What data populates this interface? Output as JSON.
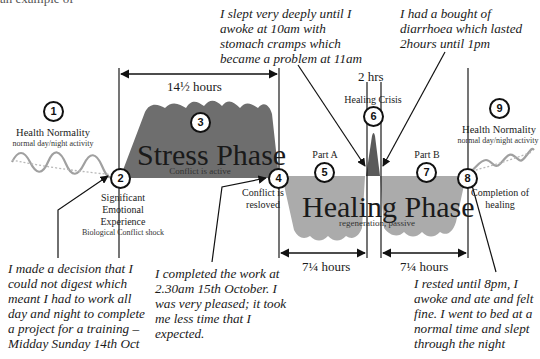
{
  "header": {
    "cropped_text": "an example of"
  },
  "colors": {
    "stress_fill": "#6e6e6e",
    "healing_fill": "#ababab",
    "crisis_fill": "#5a5a5a",
    "wave": "#9a9a9a",
    "line": "#1a1a1a"
  },
  "stages": [
    {
      "num": "1",
      "title": "Health Normality",
      "subtitle": "normal day/night activity"
    },
    {
      "num": "2",
      "title": "Significant Emotional Experience",
      "title_lines": [
        "Significant",
        "Emotional",
        "Experience"
      ],
      "subtitle": "Biological Conflict shock"
    },
    {
      "num": "3",
      "title": "Stress Phase",
      "subtitle": "Conflict is active"
    },
    {
      "num": "4",
      "title": "Conflict is resloved",
      "title_lines": [
        "Conflict is",
        "resloved"
      ]
    },
    {
      "num": "5",
      "title": "Part A"
    },
    {
      "num": "6",
      "title": "Healing Crisis"
    },
    {
      "num": "7",
      "title": "Part B"
    },
    {
      "num": "8",
      "title": "Completion of healing",
      "title_lines": [
        "Completion of",
        "healing"
      ]
    },
    {
      "num": "9",
      "title": "Health Normality",
      "subtitle": "normal day/night activity"
    }
  ],
  "healing_phase": {
    "title": "Healing Phase",
    "subtitle": "regeneration, passive"
  },
  "durations": {
    "stress": "14½ hours",
    "crisis": "2 hrs",
    "part_a": "7¼ hours",
    "part_b": "7¼ hours"
  },
  "notes": {
    "decision": [
      "I made a decision that I",
      "could not digest which",
      "meant I had to work all",
      "day and night to complete",
      "a project for a training –",
      "Midday Sunday 14th Oct"
    ],
    "completed": [
      "I completed the work at",
      "2.30am 15th October. I",
      "was very pleased; it took",
      "me less time that I",
      "expected."
    ],
    "slept": [
      "I slept very deeply until I",
      "awoke at 10am with",
      "stomach cramps which",
      "became a problem at 11am"
    ],
    "diarrhoea": [
      "I had a bought of",
      "diarrhoea which lasted",
      "2hours until 1pm"
    ],
    "rested": [
      "I rested until 8pm, I",
      "awoke and ate and felt",
      "fine. I went to bed at a",
      "normal time and slept",
      "through the night"
    ]
  }
}
